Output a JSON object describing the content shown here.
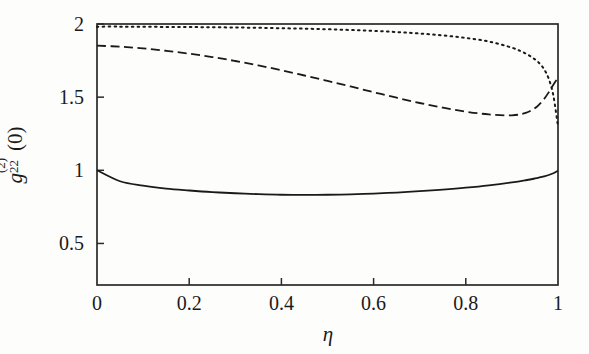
{
  "figure": {
    "background_color": "#fdfdfc",
    "axis_color": "#2a2a2a",
    "curve_color": "#1a1a1a"
  },
  "axes": {
    "x_title_glyph": "η",
    "y_title_base": "g",
    "y_title_superscript": "(2)",
    "y_title_subscript": "22",
    "y_title_suffix": "(0)",
    "x_ticks": [
      "0",
      "0.2",
      "0.4",
      "0.6",
      "0.8",
      "1"
    ],
    "y_ticks": [
      "0.5",
      "1",
      "1.5",
      "2"
    ]
  },
  "chart_data": {
    "type": "line",
    "title": "",
    "xlabel": "η",
    "ylabel": "g^{(2)}_{22}(0)",
    "xlim": [
      0,
      1
    ],
    "ylim": [
      0.216,
      2.0
    ],
    "x_ticks": [
      0,
      0.2,
      0.4,
      0.6,
      0.8,
      1
    ],
    "y_ticks": [
      0.5,
      1,
      1.5,
      2
    ],
    "grid": false,
    "legend": "none",
    "x": [
      0.0,
      0.05,
      0.1,
      0.15,
      0.2,
      0.25,
      0.3,
      0.35,
      0.4,
      0.45,
      0.5,
      0.55,
      0.6,
      0.65,
      0.7,
      0.75,
      0.8,
      0.85,
      0.9,
      0.93,
      0.95,
      0.96,
      0.97,
      0.98,
      0.99,
      1.0
    ],
    "series": [
      {
        "name": "solid",
        "style": "solid",
        "values": [
          1.0,
          0.925,
          0.895,
          0.875,
          0.862,
          0.851,
          0.843,
          0.837,
          0.833,
          0.832,
          0.833,
          0.836,
          0.841,
          0.848,
          0.857,
          0.868,
          0.881,
          0.897,
          0.917,
          0.932,
          0.944,
          0.951,
          0.959,
          0.968,
          0.98,
          0.997
        ]
      },
      {
        "name": "dashed",
        "style": "dashed",
        "values": [
          1.852,
          1.845,
          1.833,
          1.817,
          1.797,
          1.774,
          1.747,
          1.717,
          1.684,
          1.648,
          1.611,
          1.573,
          1.534,
          1.496,
          1.46,
          1.428,
          1.401,
          1.382,
          1.376,
          1.392,
          1.425,
          1.452,
          1.488,
          1.534,
          1.585,
          1.632
        ]
      },
      {
        "name": "dotted",
        "style": "dotted",
        "values": [
          1.982,
          1.982,
          1.981,
          1.98,
          1.979,
          1.978,
          1.976,
          1.974,
          1.971,
          1.968,
          1.964,
          1.959,
          1.953,
          1.945,
          1.935,
          1.922,
          1.905,
          1.88,
          1.838,
          1.798,
          1.758,
          1.73,
          1.69,
          1.625,
          1.51,
          1.3
        ]
      }
    ]
  }
}
